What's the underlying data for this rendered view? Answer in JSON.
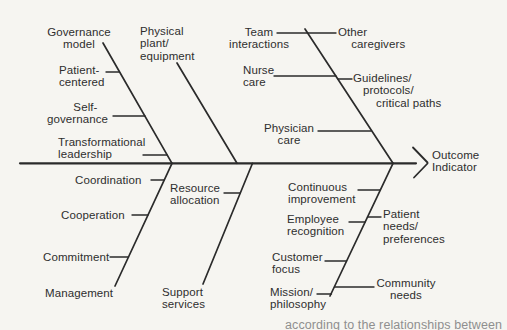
{
  "colors": {
    "background": "#f6f5f1",
    "line": "#2b2b2b",
    "text": "#2e2e2e",
    "caption_text": "#8f8f8f"
  },
  "diagram": {
    "type": "fishbone-cause-effect",
    "effect_label": "Outcome\nIndicator",
    "bones": {
      "governance": {
        "label": "Governance\nmodel",
        "causes": {
          "patient_centered": "Patient-\ncentered",
          "self_governance": "        Self-\ngovernance",
          "transformational_leadership": "Transformational\nleadership"
        }
      },
      "physical_plant": {
        "label": "Physical\nplant/\nequipment",
        "causes": {}
      },
      "team_interactions": {
        "label": "Team\ninteractions",
        "causes": {
          "other_caregivers": "Other\n    caregivers",
          "nurse_care": "Nurse\ncare",
          "guidelines": "Guidelines/\n   protocols/\n       critical paths",
          "physician_care": "Physician\ncare"
        }
      },
      "management": {
        "label": "Management",
        "causes": {
          "coordination": "Coordination",
          "cooperation": "Cooperation",
          "commitment": "Commitment"
        }
      },
      "support_services": {
        "label": "Support\nservices",
        "causes": {
          "resource_allocation": "Resource\nallocation"
        }
      },
      "mission_philosophy": {
        "label": "Mission/\nphilosophy",
        "causes": {
          "continuous_improvement": "Continuous\nimprovement",
          "employee_recognition": "Employee\nrecognition",
          "patient_needs": "Patient\nneeds/\npreferences",
          "customer_focus": "Customer\nfocus",
          "community_needs": "Community\nneeds"
        }
      }
    },
    "caption_fragment": "according to the relationships between"
  }
}
